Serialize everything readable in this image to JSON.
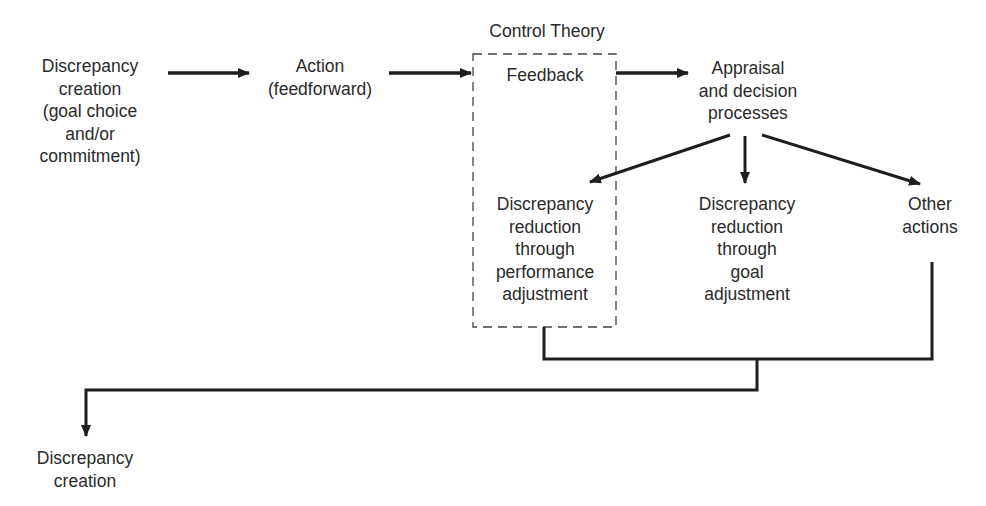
{
  "diagram": {
    "group_title": "Control Theory",
    "nodes": {
      "start": "Discrepancy\ncreation\n(goal choice\nand/or\ncommitment)",
      "action": "Action\n(feedforward)",
      "feedback": "Feedback",
      "appraisal": "Appraisal\nand decision\nprocesses",
      "perf_adjust": "Discrepancy\nreduction\nthrough\nperformance\nadjustment",
      "goal_adjust": "Discrepancy\nreduction\nthrough\ngoal\nadjustment",
      "other": "Other\nactions",
      "end": "Discrepancy\ncreation"
    },
    "edges": [
      {
        "from": "start",
        "to": "action"
      },
      {
        "from": "action",
        "to": "feedback"
      },
      {
        "from": "feedback",
        "to": "appraisal"
      },
      {
        "from": "appraisal",
        "to": "perf_adjust"
      },
      {
        "from": "appraisal",
        "to": "goal_adjust"
      },
      {
        "from": "appraisal",
        "to": "other"
      },
      {
        "from": "perf_adjust",
        "to": "end"
      },
      {
        "from": "other",
        "to": "end"
      }
    ],
    "colors": {
      "line": "#1e1e1e",
      "text": "#2a2a2a",
      "background": "#ffffff"
    }
  }
}
